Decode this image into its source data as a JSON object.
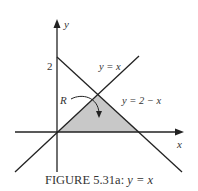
{
  "figure": {
    "axes": {
      "x_label": "x",
      "y_label": "y",
      "y_tick": "2"
    },
    "lines": [
      {
        "label": "y = x"
      },
      {
        "label": "y = 2 − x"
      }
    ],
    "region_label": "R",
    "region_fill": "#c8c8c8",
    "caption_prefix": "FIGURE 5.31a: ",
    "caption_math": "y = x"
  }
}
